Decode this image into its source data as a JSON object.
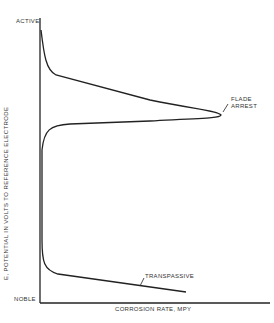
{
  "chart_data": {
    "type": "line",
    "title": "",
    "xlabel": "CORROSION RATE, MPY",
    "ylabel": "E, POTENTIAL IN VOLTS TO REFERENCE ELECTRODE",
    "y_top_label": "ACTIVE",
    "y_bottom_label": "NOBLE",
    "grid": false,
    "legend": null,
    "annotations": [
      "FLADE ARREST",
      "TRANSPASSIVE"
    ],
    "series": [
      {
        "name": "polarization curve",
        "points_px": [
          [
            41,
            30
          ],
          [
            44,
            50
          ],
          [
            48,
            68
          ],
          [
            55,
            75
          ],
          [
            80,
            83
          ],
          [
            150,
            100
          ],
          [
            218,
            113
          ],
          [
            221,
            116
          ],
          [
            216,
            118
          ],
          [
            150,
            122
          ],
          [
            70,
            125
          ],
          [
            52,
            127
          ],
          [
            44,
            135
          ],
          [
            42,
            150
          ],
          [
            42,
            240
          ],
          [
            44,
            268
          ],
          [
            48,
            272
          ],
          [
            60,
            275
          ],
          [
            120,
            284
          ],
          [
            186,
            292
          ]
        ]
      }
    ]
  }
}
